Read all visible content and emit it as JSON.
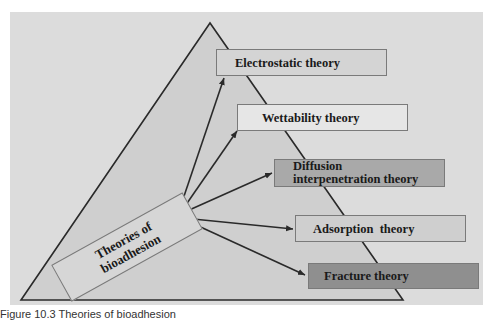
{
  "diagram": {
    "title": "Theories of bioadhesion",
    "hub": {
      "line1": "Theories of",
      "line2": "bioadhesion"
    },
    "theories": [
      {
        "label": "Electrostatic theory",
        "fill": "#d4d4d4"
      },
      {
        "label": "Wettability theory",
        "fill": "#e6e6e6"
      },
      {
        "label_line1": "Diffusion",
        "label_line2": "interpenetration theory",
        "fill": "#a9a9a9"
      },
      {
        "label": "Adsorption  theory",
        "fill": "#cfcfcf"
      },
      {
        "label": "Fracture theory",
        "fill": "#8f8f8f"
      }
    ],
    "colors": {
      "background_panel": "#dcdcdc",
      "triangle_fill": "#cfcfcf",
      "lines": "#2a2a2a",
      "box_border": "#7a7a7a"
    }
  },
  "caption": {
    "text": "Figure 10.3  Theories of bioadhesion"
  }
}
